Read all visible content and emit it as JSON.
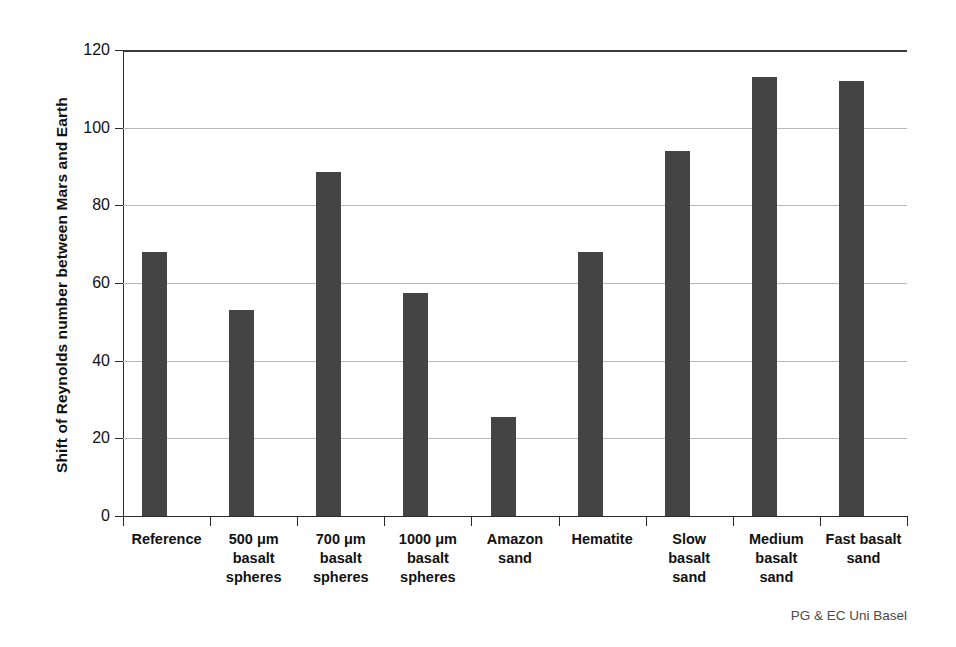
{
  "credit": "PG & EC Uni Basel",
  "chart_data": {
    "type": "bar",
    "title": "",
    "xlabel": "",
    "ylabel": "Shift of Reynolds number between Mars and Earth",
    "ylim": [
      0,
      120
    ],
    "ytick_labels": [
      "0",
      "20",
      "40",
      "60",
      "80",
      "100",
      "120"
    ],
    "yticks": [
      0,
      20,
      40,
      60,
      80,
      100,
      120
    ],
    "grid": true,
    "legend": "none",
    "bar_color": "#444444",
    "gridline_color": "#b9b9b9",
    "axis_color": "#2b2b2b",
    "categories": [
      "Reference",
      "500 μm\nbasalt\nspheres",
      "700 μm\nbasalt\nspheres",
      "1000 μm\nbasalt\nspheres",
      "Amazon\nsand",
      "Hematite",
      "Slow\nbasalt\nsand",
      "Medium\nbasalt\nsand",
      "Fast basalt\nsand"
    ],
    "values": [
      68,
      53,
      88.5,
      57.5,
      25.5,
      68,
      94,
      113,
      112
    ]
  }
}
